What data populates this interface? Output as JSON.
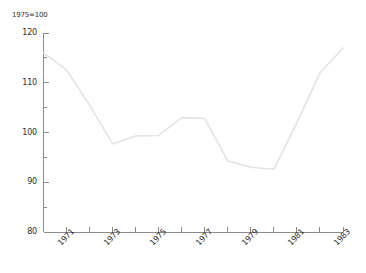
{
  "chart_data": {
    "type": "line",
    "title": "",
    "subtitle": "",
    "unit_note": "1975=100",
    "xlabel": "",
    "ylabel": "",
    "xlim": [
      1970,
      1983
    ],
    "ylim": [
      80,
      120
    ],
    "grid": false,
    "legend": "none",
    "line_color": "#e3e3e3",
    "axis_color": "#8c8c8c",
    "y_major_ticks": [
      80,
      90,
      100,
      110,
      120
    ],
    "y_minor_ticks": [
      85,
      95,
      105,
      115
    ],
    "y_tick_labels": [
      "80",
      "90",
      "100",
      "110",
      "120"
    ],
    "x_ticks": [
      1970,
      1971,
      1972,
      1973,
      1974,
      1975,
      1976,
      1977,
      1978,
      1979,
      1980,
      1981,
      1982,
      1983
    ],
    "x_tick_labels": [
      "1971",
      "1973",
      "1975",
      "1977",
      "1979",
      "1981",
      "1983"
    ],
    "x_labeled_years": [
      1971,
      1973,
      1975,
      1977,
      1979,
      1981,
      1983
    ],
    "x": [
      1970,
      1971,
      1972,
      1973,
      1974,
      1975,
      1976,
      1977,
      1978,
      1979,
      1980,
      1981,
      1982,
      1983
    ],
    "values": [
      116.0,
      112.6,
      105.5,
      97.7,
      99.3,
      99.4,
      103.0,
      102.8,
      94.3,
      93.0,
      92.6,
      102.0,
      112.0,
      117.0
    ],
    "series": [
      {
        "name": "index",
        "values": [
          116.0,
          112.6,
          105.5,
          97.7,
          99.3,
          99.4,
          103.0,
          102.8,
          94.3,
          93.0,
          92.6,
          102.0,
          112.0,
          117.0
        ]
      }
    ]
  }
}
